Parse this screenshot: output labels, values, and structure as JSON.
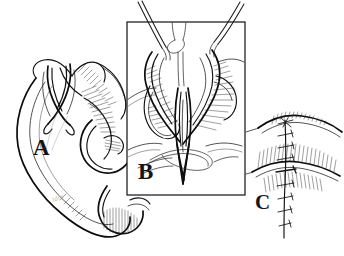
{
  "figure": {
    "medium": "pen-and-ink line drawing",
    "background_color": "#ffffff",
    "ink_color": "#1a1a1a",
    "width": 344,
    "height": 256,
    "artist_signature": "ldrs"
  },
  "panels": [
    {
      "id": "A",
      "label": "A",
      "name": "panel-a-ear-overview",
      "description": "Lateral view of the external ear (auricle) showing a full-thickness vertical incision through the helical rim and scapha, with the wound edges retracted apart; helix, antihelix, concha, tragus and lobule are rendered with fine cross-hatching.",
      "label_position": {
        "x": 33,
        "y": 136
      },
      "framed": false
    },
    {
      "id": "B",
      "label": "B",
      "name": "panel-b-magnified-inset",
      "description": "Boxed magnified inset of the incision site. Two skin hooks / retractors enter from the upper left and upper right holding the wound edges open, exposing the cartilage. A curved needle with suture thread passes through the tissue and a suture loop lies across the lower wound.",
      "label_position": {
        "x": 138,
        "y": 160
      },
      "framed": true,
      "frame": {
        "x": 127,
        "y": 22,
        "width": 118,
        "height": 173
      },
      "instruments": [
        {
          "name": "retractor-hook-left",
          "entry": "upper-left"
        },
        {
          "name": "retractor-hook-right",
          "entry": "upper-right"
        },
        {
          "name": "suture-needle",
          "entry": "center-vertical"
        },
        {
          "name": "suture-loop",
          "entry": "lower-center"
        }
      ]
    },
    {
      "id": "C",
      "label": "C",
      "name": "panel-c-closed-repair",
      "description": "Close-up of the completed repair: the incision is closed with a vertical row of interrupted sutures, knots tied, tissue edges approximated with stippled shading on either side.",
      "label_position": {
        "x": 255,
        "y": 192
      },
      "framed": false,
      "suture_count": 9,
      "suture_type": "interrupted"
    }
  ],
  "labels": {
    "a": "A",
    "b": "B",
    "c": "C"
  }
}
